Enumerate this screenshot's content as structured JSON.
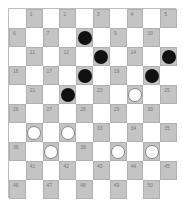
{
  "board": {
    "size": 10,
    "colors": {
      "light": "#ffffff",
      "dark": "#c4c4c4",
      "black_piece": "#111111",
      "white_piece": "#ffffff"
    },
    "pieces": {
      "black": [
        8,
        13,
        15,
        18,
        20,
        22
      ],
      "white": [
        24,
        31,
        32,
        37,
        39,
        40
      ]
    }
  }
}
